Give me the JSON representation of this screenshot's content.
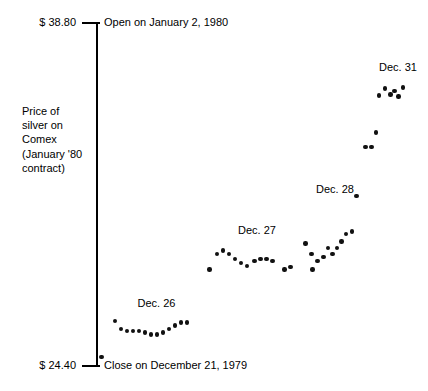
{
  "chart_data": {
    "type": "scatter",
    "title": "",
    "subtitle": "",
    "xlabel": "",
    "ylabel": "Price of silver on Comex (January '80 contract)",
    "ylim": [
      24.4,
      38.8
    ],
    "y_tick_labels": [
      "$ 38.80",
      "$ 24.40"
    ],
    "y_tick_values": [
      38.8,
      24.4
    ],
    "grid": false,
    "legend": "none",
    "axis_style": "single vertical axis at left with end ticks only",
    "annotations": [
      {
        "name": "open-note",
        "text": "Open on January 2, 1980",
        "at_value": 38.8,
        "position": "top, right of axis"
      },
      {
        "name": "close-note",
        "text": "Close on December 21, 1979",
        "at_value": 24.4,
        "position": "bottom, right of axis"
      }
    ],
    "series": [
      {
        "name": "Close on December 21, 1979",
        "label": "",
        "points": [
          {
            "x": 0.5,
            "y": 24.78
          }
        ]
      },
      {
        "name": "Dec. 26",
        "label": "Dec. 26",
        "label_x": 12.5,
        "label_y": 27.3,
        "points": [
          {
            "x": 5.0,
            "y": 26.3
          },
          {
            "x": 7.0,
            "y": 25.95
          },
          {
            "x": 9.0,
            "y": 25.88
          },
          {
            "x": 11.0,
            "y": 25.88
          },
          {
            "x": 13.0,
            "y": 25.88
          },
          {
            "x": 15.0,
            "y": 25.8
          },
          {
            "x": 17.0,
            "y": 25.72
          },
          {
            "x": 19.0,
            "y": 25.72
          },
          {
            "x": 21.0,
            "y": 25.8
          },
          {
            "x": 23.0,
            "y": 25.95
          },
          {
            "x": 25.0,
            "y": 26.1
          },
          {
            "x": 27.0,
            "y": 26.22
          },
          {
            "x": 29.0,
            "y": 26.22
          }
        ]
      },
      {
        "name": "Dec. 27",
        "label": "Dec. 27",
        "label_x": 46.0,
        "label_y": 30.35,
        "points": [
          {
            "x": 36.5,
            "y": 28.45
          },
          {
            "x": 39.0,
            "y": 29.1
          },
          {
            "x": 41.0,
            "y": 29.25
          },
          {
            "x": 43.0,
            "y": 29.1
          },
          {
            "x": 45.0,
            "y": 28.9
          },
          {
            "x": 47.0,
            "y": 28.72
          },
          {
            "x": 49.0,
            "y": 28.6
          },
          {
            "x": 51.5,
            "y": 28.82
          },
          {
            "x": 53.5,
            "y": 28.9
          },
          {
            "x": 55.5,
            "y": 28.9
          },
          {
            "x": 57.5,
            "y": 28.82
          },
          {
            "x": 61.5,
            "y": 28.45
          },
          {
            "x": 63.5,
            "y": 28.55
          }
        ]
      },
      {
        "name": "Dec. 28",
        "label": "Dec. 28",
        "label_x": 72.0,
        "label_y": 32.1,
        "points": [
          {
            "x": 68.5,
            "y": 29.55
          },
          {
            "x": 70.5,
            "y": 29.1
          },
          {
            "x": 70.8,
            "y": 28.45
          },
          {
            "x": 72.5,
            "y": 28.8
          },
          {
            "x": 74.5,
            "y": 28.98
          },
          {
            "x": 76.0,
            "y": 29.35
          },
          {
            "x": 77.5,
            "y": 29.1
          },
          {
            "x": 79.0,
            "y": 29.35
          },
          {
            "x": 80.5,
            "y": 29.62
          },
          {
            "x": 82.0,
            "y": 29.95
          },
          {
            "x": 84.0,
            "y": 30.05
          },
          {
            "x": 85.5,
            "y": 31.55
          }
        ]
      },
      {
        "name": "Dec. 31 pre-rally",
        "label": "",
        "points": [
          {
            "x": 88.5,
            "y": 33.6
          },
          {
            "x": 90.5,
            "y": 33.6
          },
          {
            "x": 92.0,
            "y": 34.2
          }
        ]
      },
      {
        "name": "Dec. 31",
        "label": "Dec. 31",
        "label_x": 93.0,
        "label_y": 37.2,
        "points": [
          {
            "x": 93.0,
            "y": 35.75
          },
          {
            "x": 95.0,
            "y": 36.05
          },
          {
            "x": 96.8,
            "y": 35.8
          },
          {
            "x": 98.2,
            "y": 35.95
          },
          {
            "x": 99.5,
            "y": 35.72
          },
          {
            "x": 101.0,
            "y": 36.1
          }
        ]
      }
    ]
  },
  "axis": {
    "max_label": "$ 38.80",
    "min_label": "$ 24.40"
  },
  "notes": {
    "open": "Open on January 2, 1980",
    "close": "Close on December 21, 1979"
  },
  "ylabel_lines": [
    "Price of",
    "silver on",
    "Comex",
    "(January '80",
    "contract)"
  ],
  "cluster_labels": {
    "dec26": "Dec. 26",
    "dec27": "Dec. 27",
    "dec28": "Dec. 28",
    "dec31": "Dec. 31"
  },
  "colors": {
    "point": "#111111",
    "axis": "#000000",
    "text": "#000000",
    "background": "#ffffff"
  }
}
